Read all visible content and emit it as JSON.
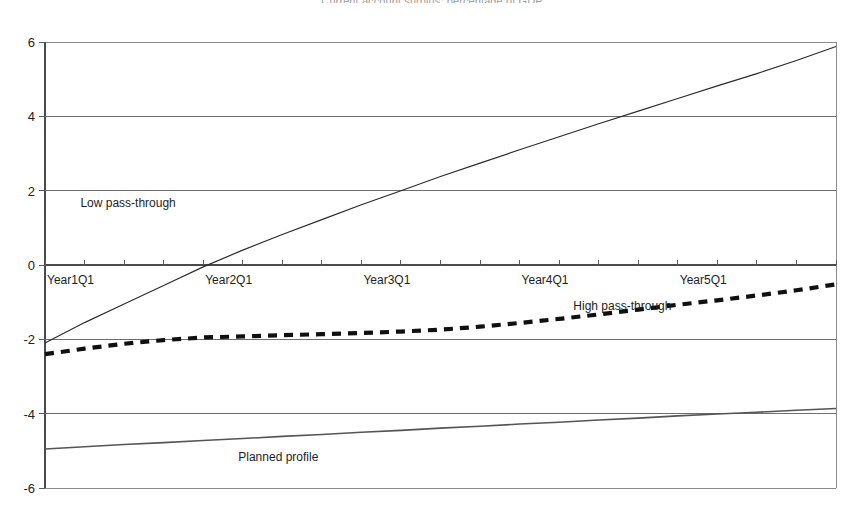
{
  "chart_data": {
    "type": "line",
    "title": "Current account surplus: percentage of GDP",
    "xlabel": "",
    "ylabel": "",
    "ylim": [
      -6,
      6
    ],
    "yticks": [
      "6",
      "4",
      "2",
      "0",
      "-2",
      "-4",
      "-6"
    ],
    "ytick_values": [
      6,
      4,
      2,
      0,
      -2,
      -4,
      -6
    ],
    "grid": true,
    "legend_position": "inline-annotations",
    "x": [
      "Year1Q1",
      "Year1Q2",
      "Year1Q3",
      "Year1Q4",
      "Year2Q1",
      "Year2Q2",
      "Year2Q3",
      "Year2Q4",
      "Year3Q1",
      "Year3Q2",
      "Year3Q3",
      "Year3Q4",
      "Year4Q1",
      "Year4Q2",
      "Year4Q3",
      "Year4Q4",
      "Year5Q1",
      "Year5Q2",
      "Year5Q3",
      "Year5Q4",
      "Year6Q1"
    ],
    "xticks": [
      "Year1Q1",
      "Year2Q1",
      "Year3Q1",
      "Year4Q1",
      "Year5Q1"
    ],
    "xtick_positions": [
      0,
      4,
      8,
      12,
      16
    ],
    "series": [
      {
        "name": "Low pass-through",
        "style": "solid",
        "label_x_index": 2.1,
        "label_y": 1.55,
        "values": [
          -2.1,
          -1.55,
          -1.05,
          -0.55,
          -0.05,
          0.4,
          0.82,
          1.22,
          1.62,
          2.0,
          2.38,
          2.74,
          3.1,
          3.45,
          3.8,
          4.14,
          4.48,
          4.82,
          5.15,
          5.5,
          5.88
        ]
      },
      {
        "name": "High pass-through",
        "style": "dashed",
        "label_x_index": 14.6,
        "label_y": -1.22,
        "values": [
          -2.4,
          -2.25,
          -2.12,
          -2.02,
          -1.95,
          -1.92,
          -1.89,
          -1.86,
          -1.83,
          -1.79,
          -1.74,
          -1.66,
          -1.56,
          -1.45,
          -1.33,
          -1.2,
          -1.07,
          -0.95,
          -0.82,
          -0.68,
          -0.52
        ]
      },
      {
        "name": "Planned profile",
        "style": "solid-thin",
        "label_x_index": 5.9,
        "label_y": -5.28,
        "values": [
          -4.95,
          -4.89,
          -4.83,
          -4.78,
          -4.72,
          -4.67,
          -4.61,
          -4.56,
          -4.5,
          -4.45,
          -4.39,
          -4.34,
          -4.28,
          -4.23,
          -4.17,
          -4.12,
          -4.06,
          -4.01,
          -3.96,
          -3.91,
          -3.86
        ]
      }
    ]
  },
  "colors": {
    "axis": "#4a4a4a",
    "grid": "#6e6e6e",
    "low_pass_through": "#2b2b2b",
    "high_pass_through": "#101010",
    "planned_profile": "#555555",
    "background": "#ffffff"
  }
}
